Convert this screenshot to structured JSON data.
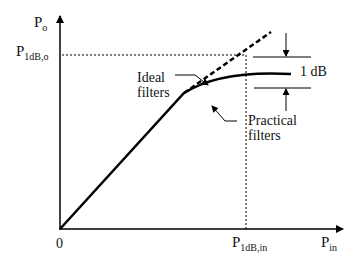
{
  "diagram": {
    "type": "1dB compression point plot",
    "y_axis": {
      "label_main": "P",
      "label_sub": "o"
    },
    "x_axis": {
      "label_main": "P",
      "label_sub": "in"
    },
    "origin_label": "0",
    "y_marker": {
      "label_main": "P",
      "label_sub": "1dB,o"
    },
    "x_marker": {
      "label_main": "P",
      "label_sub": "1dB,in"
    },
    "annotations": {
      "ideal": {
        "line1": "Ideal",
        "line2": "filters"
      },
      "practical": {
        "line1": "Practical",
        "line2": "filters"
      },
      "gap": "1 dB"
    },
    "colors": {
      "line": "#000000",
      "background": "#ffffff"
    }
  }
}
